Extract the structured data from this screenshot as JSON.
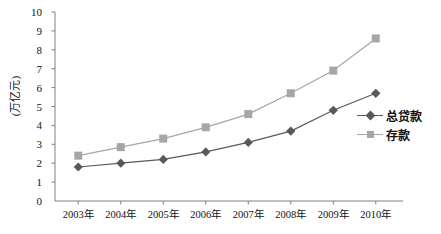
{
  "chart_data": {
    "type": "line",
    "title": "",
    "xlabel": "",
    "ylabel": "(万亿元)",
    "categories": [
      "2003年",
      "2004年",
      "2005年",
      "2006年",
      "2007年",
      "2008年",
      "2009年",
      "2010年"
    ],
    "ylim": [
      0,
      10
    ],
    "ytick_labels": [
      "0",
      "1",
      "2",
      "3",
      "4",
      "5",
      "6",
      "7",
      "8",
      "9",
      "10"
    ],
    "ytick_values": [
      0,
      1,
      2,
      3,
      4,
      5,
      6,
      7,
      8,
      9,
      10
    ],
    "grid": false,
    "legend_position": "right",
    "series": [
      {
        "name": "总贷款",
        "marker": "diamond",
        "color": "#595959",
        "values": [
          1.8,
          2.0,
          2.2,
          2.6,
          3.1,
          3.7,
          4.8,
          5.7
        ]
      },
      {
        "name": "存款",
        "marker": "square",
        "color": "#a6a6a6",
        "values": [
          2.4,
          2.85,
          3.3,
          3.9,
          4.6,
          5.7,
          6.9,
          8.6
        ]
      }
    ]
  },
  "axis": {
    "line_color": "#808080"
  }
}
